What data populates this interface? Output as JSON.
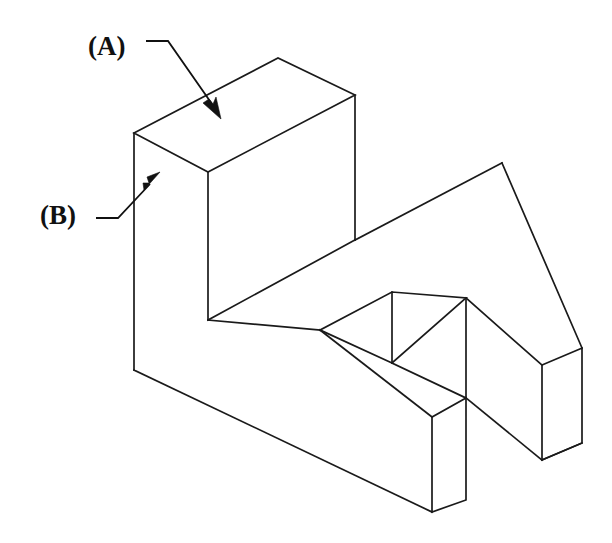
{
  "figure": {
    "kind": "isometric-engineering-drawing",
    "background_color": "#ffffff",
    "line_color": "#1a1a1a",
    "line_width_px": 1.7,
    "canvas": {
      "width": 612,
      "height": 543
    }
  },
  "callouts": [
    {
      "id": "A",
      "label": "(A)",
      "text_x": 88,
      "text_y": 55,
      "points_to": "top-face-of-tall-block",
      "leader_path": "M 146 41 L 168 41 L 212 104",
      "arrow_tip_x": 219,
      "arrow_tip_y": 115,
      "arrow_angle_deg": 55
    },
    {
      "id": "B",
      "label": "(B)",
      "text_x": 40,
      "text_y": 224,
      "points_to": "left-side-face-of-tall-block",
      "leader_path": "M 96 218 L 118 218 L 148 186",
      "arrow_tip_x": 157,
      "arrow_tip_y": 176,
      "arrow_angle_deg": -48
    }
  ],
  "geometry": {
    "top_face_points": "134,133 278,58 355,95 208,172",
    "left_face_points": "134,133 208,172 208,320 134,370",
    "front_face_points": "208,172 355,95 355,240 208,320",
    "step_top_points": "355,240 466,298 320,330 208,320",
    "lower_left_face_points": "134,370 208,320 208,320 134,370",
    "outline_points": "134,133 278,58 355,95 355,240 582,348 582,443 466,500 466,398 432,417 432,512 208,320 134,370",
    "slot_points": "320,330 392,292 466,298 392,363",
    "slot_inner_edge": "392,292 392,363",
    "right_prong_top": "355,240 502,163 582,348 466,298",
    "right_end_face": "582,348 582,443 542,460 542,365",
    "front_prong_end_face": "466,398 466,500 432,512 432,417"
  },
  "vertices": {
    "top_left": [
      134,
      133
    ],
    "top_back": [
      278,
      58
    ],
    "top_right": [
      355,
      95
    ],
    "top_front": [
      208,
      172
    ],
    "left_bottom": [
      134,
      370
    ],
    "front_bottom": [
      208,
      320
    ],
    "mid_right": [
      355,
      240
    ],
    "slot_left_tip": [
      320,
      330
    ],
    "slot_back_corner": [
      392,
      292
    ],
    "slot_right_corner": [
      466,
      298
    ],
    "slot_front_corner": [
      392,
      363
    ],
    "far_right_top": [
      582,
      348
    ],
    "far_right_bottom": [
      582,
      443
    ],
    "far_right_front_top": [
      542,
      365
    ],
    "far_right_front_bottom": [
      542,
      460
    ],
    "prong_end_top_right": [
      466,
      398
    ],
    "prong_end_top_left": [
      432,
      417
    ],
    "prong_end_bottom_left": [
      432,
      512
    ],
    "prong_end_bottom_right": [
      466,
      500
    ]
  }
}
